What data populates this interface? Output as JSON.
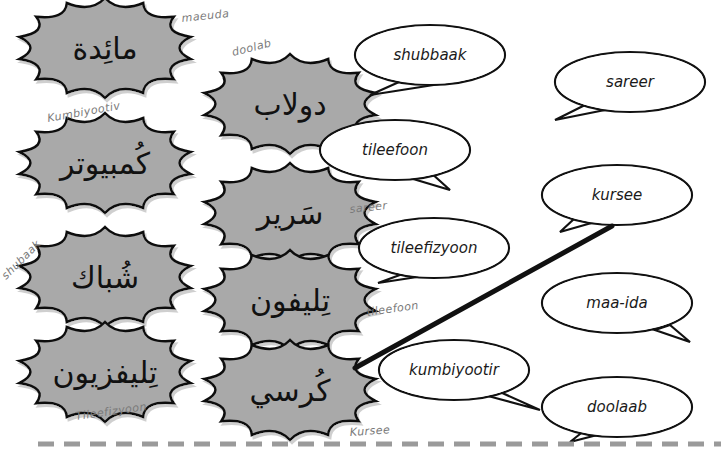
{
  "worksheet": {
    "arabic_words": [
      {
        "id": "maaida",
        "text": "مائِدة",
        "handwritten": "maeuda"
      },
      {
        "id": "doolaab",
        "text": "دولاب",
        "handwritten": "doolab"
      },
      {
        "id": "kumbiyootir",
        "text": "كُمبيوتر",
        "handwritten": "Kumbiyootiv"
      },
      {
        "id": "sareer",
        "text": "سَرير",
        "handwritten": "sareer"
      },
      {
        "id": "shubbaak",
        "text": "شُباك",
        "handwritten": "shubaak"
      },
      {
        "id": "tileefoon",
        "text": "تِليفون",
        "handwritten": "tileefoon"
      },
      {
        "id": "tileefizyoon",
        "text": "تِليفزيون",
        "handwritten": "Tileefizyoon"
      },
      {
        "id": "kursee",
        "text": "كُرسي",
        "handwritten": "Kursee"
      }
    ],
    "bubbles": [
      {
        "text": "shubbaak"
      },
      {
        "text": "sareer"
      },
      {
        "text": "tileefoon"
      },
      {
        "text": "kursee"
      },
      {
        "text": "tileefizyoon"
      },
      {
        "text": "maa-ida"
      },
      {
        "text": "kumbiyootir"
      },
      {
        "text": "doolaab"
      }
    ],
    "matched_line": {
      "from": "kursee-burst",
      "to": "kursee-bubble"
    },
    "colors": {
      "burst_fill": "#a9a9a9",
      "outline": "#111111",
      "handwriting": "#7a7a7a",
      "dash": "#9a9a9a"
    }
  }
}
